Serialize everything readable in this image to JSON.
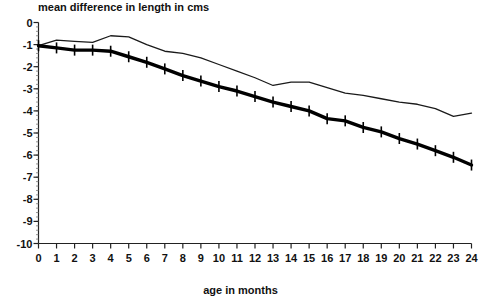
{
  "chart_data": {
    "type": "line",
    "title": "mean difference in length in cms",
    "xlabel": "age in months",
    "ylabel": "",
    "grid": false,
    "legend": "none",
    "xlim": [
      0,
      24
    ],
    "ylim": [
      -10,
      0
    ],
    "x": [
      0,
      1,
      2,
      3,
      4,
      5,
      6,
      7,
      8,
      9,
      10,
      11,
      12,
      13,
      14,
      15,
      16,
      17,
      18,
      19,
      20,
      21,
      22,
      23,
      24
    ],
    "xticks": [
      "0",
      "1",
      "2",
      "3",
      "4",
      "5",
      "6",
      "7",
      "8",
      "9",
      "10",
      "11",
      "12",
      "13",
      "14",
      "15",
      "16",
      "17",
      "18",
      "19",
      "20",
      "21",
      "22",
      "23",
      "24"
    ],
    "yticks": [
      "0",
      "-1",
      "-2",
      "-3",
      "-4",
      "-5",
      "-6",
      "-7",
      "-8",
      "-9",
      "-10"
    ],
    "series": [
      {
        "name": "upper curve (thin line)",
        "style": "thin-line",
        "markers": "none",
        "values": [
          -1.05,
          -0.8,
          -0.85,
          -0.9,
          -0.6,
          -0.65,
          -1.0,
          -1.3,
          -1.4,
          -1.6,
          -1.9,
          -2.2,
          -2.5,
          -2.85,
          -2.7,
          -2.7,
          -2.95,
          -3.2,
          -3.3,
          -3.45,
          -3.6,
          -3.7,
          -3.9,
          -4.25,
          -4.1
        ]
      },
      {
        "name": "lower curve (thick line with tick markers)",
        "style": "thick-line",
        "markers": "vertical-tick",
        "values": [
          -1.05,
          -1.15,
          -1.25,
          -1.25,
          -1.3,
          -1.55,
          -1.8,
          -2.1,
          -2.4,
          -2.65,
          -2.9,
          -3.1,
          -3.35,
          -3.6,
          -3.8,
          -4.0,
          -4.35,
          -4.45,
          -4.75,
          -4.95,
          -5.25,
          -5.5,
          -5.8,
          -6.1,
          -6.45
        ]
      }
    ]
  }
}
